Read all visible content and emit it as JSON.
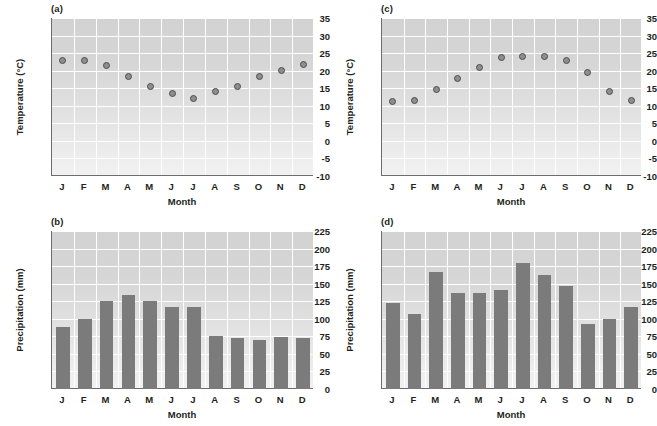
{
  "figure": {
    "panels": [
      "a",
      "b",
      "c",
      "d"
    ]
  },
  "panel_a": {
    "tag": "(a)",
    "chart_data": {
      "type": "scatter",
      "title": "(a)",
      "xlabel": "Month",
      "ylabel": "Temperature (°C)",
      "categories": [
        "J",
        "F",
        "M",
        "A",
        "M",
        "J",
        "J",
        "A",
        "S",
        "O",
        "N",
        "D"
      ],
      "values": [
        22.8,
        22.8,
        21.6,
        18.3,
        15.6,
        13.5,
        12.2,
        14.2,
        15.5,
        18.3,
        20.1,
        21.8
      ],
      "ylim": [
        -10,
        35
      ],
      "yticks": [
        -10,
        -5,
        0,
        5,
        10,
        15,
        20,
        25,
        30,
        35
      ],
      "ytick_labels": [
        "-10",
        "-5",
        "0",
        "5",
        "10",
        "15",
        "20",
        "25",
        "30",
        "35"
      ],
      "grid": true,
      "legend": "none"
    }
  },
  "panel_b": {
    "tag": "(b)",
    "chart_data": {
      "type": "bar",
      "title": "(b)",
      "xlabel": "Month",
      "ylabel": "Precipitation (mm)",
      "categories": [
        "J",
        "F",
        "M",
        "A",
        "M",
        "J",
        "J",
        "A",
        "S",
        "O",
        "N",
        "D"
      ],
      "values": [
        88,
        100,
        126,
        134,
        126,
        117,
        117,
        76,
        73,
        70,
        74,
        73
      ],
      "ylim": [
        0,
        225
      ],
      "yticks": [
        0,
        25,
        50,
        75,
        100,
        125,
        150,
        175,
        200,
        225
      ],
      "ytick_labels": [
        "0",
        "25",
        "50",
        "75",
        "100",
        "125",
        "150",
        "175",
        "200",
        "225"
      ],
      "grid": true,
      "legend": "none"
    }
  },
  "panel_c": {
    "tag": "(c)",
    "chart_data": {
      "type": "scatter",
      "title": "(c)",
      "xlabel": "Month",
      "ylabel": "Temperature (°C)",
      "categories": [
        "J",
        "F",
        "M",
        "A",
        "M",
        "J",
        "J",
        "A",
        "S",
        "O",
        "N",
        "D"
      ],
      "values": [
        11.2,
        11.5,
        14.5,
        17.9,
        21.0,
        23.7,
        24.1,
        24.1,
        22.8,
        19.4,
        14.1,
        11.5
      ],
      "ylim": [
        -10,
        35
      ],
      "yticks": [
        -10,
        -5,
        0,
        5,
        10,
        15,
        20,
        25,
        30,
        35
      ],
      "ytick_labels": [
        "-10",
        "-5",
        "0",
        "5",
        "10",
        "15",
        "20",
        "25",
        "30",
        "35"
      ],
      "grid": true,
      "legend": "none"
    }
  },
  "panel_d": {
    "tag": "(d)",
    "chart_data": {
      "type": "bar",
      "title": "(d)",
      "xlabel": "Month",
      "ylabel": "Precipitation (mm)",
      "categories": [
        "J",
        "F",
        "M",
        "A",
        "M",
        "J",
        "J",
        "A",
        "S",
        "O",
        "N",
        "D"
      ],
      "values": [
        122,
        107,
        167,
        136,
        136,
        141,
        179,
        162,
        146,
        93,
        100,
        117
      ],
      "ylim": [
        0,
        225
      ],
      "yticks": [
        0,
        25,
        50,
        75,
        100,
        125,
        150,
        175,
        200,
        225
      ],
      "ytick_labels": [
        "0",
        "25",
        "50",
        "75",
        "100",
        "125",
        "150",
        "175",
        "200",
        "225"
      ],
      "grid": true,
      "legend": "none"
    }
  },
  "colors": {
    "marker_fill": "#8e8e8e",
    "marker_edge": "#4d4d4d",
    "bar_fill": "#7b7b7b",
    "axis": "#6d6d6d",
    "grid": "#ffffff",
    "text": "#231f20"
  }
}
